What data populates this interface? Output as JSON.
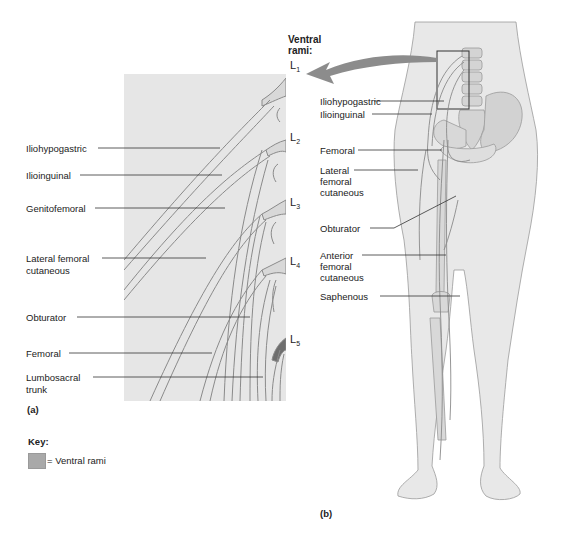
{
  "panel_a": {
    "caption": "(a)",
    "labels": [
      {
        "id": "iliohypogastric",
        "text": "Iliohypogastric"
      },
      {
        "id": "ilioinguinal",
        "text": "Ilioinguinal"
      },
      {
        "id": "genitofemoral",
        "text": "Genitofemoral"
      },
      {
        "id": "lateral_femoral_cutaneous",
        "text": "Lateral femoral\ncutaneous"
      },
      {
        "id": "obturator",
        "text": "Obturator"
      },
      {
        "id": "femoral",
        "text": "Femoral"
      },
      {
        "id": "lumbosacral_trunk",
        "text": "Lumbosacral\ntrunk"
      }
    ],
    "label_text": {
      "iliohypogastric": "Iliohypogastric",
      "ilioinguinal": "Ilioinguinal",
      "genitofemoral": "Genitofemoral",
      "lateral_femoral_1": "Lateral femoral",
      "lateral_femoral_2": "cutaneous",
      "obturator": "Obturator",
      "femoral": "Femoral",
      "lumbosacral_1": "Lumbosacral",
      "lumbosacral_2": "trunk"
    },
    "ventral_rami_heading_1": "Ventral",
    "ventral_rami_heading_2": "rami:",
    "spinal_levels": [
      {
        "letter": "L",
        "number": "1"
      },
      {
        "letter": "L",
        "number": "2"
      },
      {
        "letter": "L",
        "number": "3"
      },
      {
        "letter": "L",
        "number": "4"
      },
      {
        "letter": "L",
        "number": "5"
      }
    ]
  },
  "panel_b": {
    "caption": "(b)",
    "label_text": {
      "iliohypogastric": "Iliohypogastric",
      "ilioinguinal": "Ilioinguinal",
      "femoral": "Femoral",
      "lateral_1": "Lateral",
      "lateral_2": "femoral",
      "lateral_3": "cutaneous",
      "obturator": "Obturator",
      "anterior_1": "Anterior",
      "anterior_2": "femoral",
      "anterior_3": "cutaneous",
      "saphenous": "Saphenous"
    }
  },
  "key": {
    "title": "Key:",
    "items": [
      {
        "swatch_color": "#a9a9a9",
        "label": "= Ventral rami"
      }
    ]
  },
  "colors": {
    "panel_background": "#e6e6e6",
    "nerve_fill": "#dcdcdc",
    "nerve_stroke": "#8a8a8a",
    "skin": "#e8e8e8",
    "bone": "#d4d4d4",
    "arrow": "#8c8c8c"
  }
}
